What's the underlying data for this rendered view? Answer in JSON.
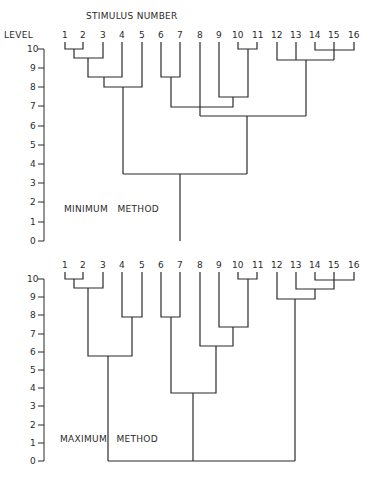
{
  "header": {
    "title": "STIMULUS NUMBER",
    "axis_label": "LEVEL"
  },
  "leaves": [
    "1",
    "2",
    "3",
    "4",
    "5",
    "6",
    "7",
    "8",
    "9",
    "10",
    "11",
    "12",
    "13",
    "14",
    "15",
    "16"
  ],
  "axis_ticks": [
    "0",
    "1",
    "2",
    "3",
    "4",
    "5",
    "6",
    "7",
    "8",
    "9",
    "10"
  ],
  "dendrograms": [
    {
      "method_label": "MINIMUM   METHOD",
      "merges": [
        {
          "items": [
            "1",
            "2"
          ],
          "level": 10
        },
        {
          "items": [
            "1-2",
            "3"
          ],
          "level": 9.5
        },
        {
          "items": [
            "1-3",
            "4"
          ],
          "level": 8.5
        },
        {
          "items": [
            "1-4",
            "5"
          ],
          "level": 8
        },
        {
          "items": [
            "6",
            "7"
          ],
          "level": 8.5
        },
        {
          "items": [
            "10",
            "11"
          ],
          "level": 10
        },
        {
          "items": [
            "9",
            "10-11"
          ],
          "level": 7.5
        },
        {
          "items": [
            "6-7",
            "9-11"
          ],
          "level": 7
        },
        {
          "items": [
            "14",
            "15",
            "16"
          ],
          "level": 10
        },
        {
          "items": [
            "12",
            "13",
            "14-16"
          ],
          "level": 9.5
        },
        {
          "items": [
            "8",
            "6-7,9-11",
            "12-16"
          ],
          "level": 6.5
        },
        {
          "items": [
            "1-5",
            "6-16"
          ],
          "level": 3.5
        }
      ]
    },
    {
      "method_label": "MAXIMUM   METHOD",
      "merges": [
        {
          "items": [
            "1",
            "2"
          ],
          "level": 10
        },
        {
          "items": [
            "1-2",
            "3"
          ],
          "level": 9.5
        },
        {
          "items": [
            "4",
            "5"
          ],
          "level": 8
        },
        {
          "items": [
            "1-3",
            "4-5"
          ],
          "level": 6
        },
        {
          "items": [
            "6",
            "7"
          ],
          "level": 8
        },
        {
          "items": [
            "10",
            "11"
          ],
          "level": 10
        },
        {
          "items": [
            "9",
            "10-11"
          ],
          "level": 7.5
        },
        {
          "items": [
            "8",
            "9-11"
          ],
          "level": 6.5
        },
        {
          "items": [
            "6-7",
            "8-11"
          ],
          "level": 3.5
        },
        {
          "items": [
            "14",
            "15",
            "16"
          ],
          "level": 10
        },
        {
          "items": [
            "13",
            "14-16"
          ],
          "level": 9.5
        },
        {
          "items": [
            "12",
            "13-16"
          ],
          "level": 9
        },
        {
          "items": [
            "1-5",
            "6-11",
            "12-16"
          ],
          "level": 0
        }
      ]
    }
  ]
}
